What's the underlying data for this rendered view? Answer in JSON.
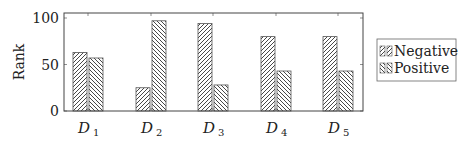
{
  "chart_data": {
    "type": "bar",
    "title": "",
    "xlabel": "",
    "ylabel": "Rank",
    "ylim": [
      0,
      100
    ],
    "yticks": [
      0,
      50,
      100
    ],
    "categories": [
      "D1",
      "D2",
      "D3",
      "D4",
      "D5"
    ],
    "category_labels": [
      {
        "base": "D",
        "sub": "1"
      },
      {
        "base": "D",
        "sub": "2"
      },
      {
        "base": "D",
        "sub": "3"
      },
      {
        "base": "D",
        "sub": "4"
      },
      {
        "base": "D",
        "sub": "5"
      }
    ],
    "series": [
      {
        "name": "Negative",
        "values": [
          63,
          25,
          94,
          80,
          80
        ],
        "pattern": "hatch-northeast"
      },
      {
        "name": "Positive",
        "values": [
          57,
          97,
          28,
          43,
          43
        ],
        "pattern": "hatch-northwest"
      }
    ],
    "grid": false,
    "legend_position": "right"
  },
  "colors": {
    "axis": "#444444",
    "hatch": "#333333"
  }
}
